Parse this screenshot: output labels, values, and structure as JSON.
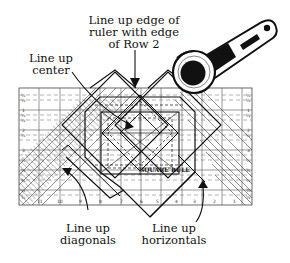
{
  "diagram": {
    "colors": {
      "ink": "#111111",
      "grid": "#555555",
      "background": "#ffffff"
    },
    "labels": {
      "top": {
        "lines": [
          "Line up edge of",
          "ruler with edge",
          "of Row 2"
        ]
      },
      "left": {
        "lines": [
          "Line up",
          "center"
        ]
      },
      "bottom_left": {
        "lines": [
          "Line up",
          "diagonals"
        ]
      },
      "bottom_right": {
        "lines": [
          "Line up",
          "horizontals"
        ]
      }
    },
    "ruler": {
      "brand_text": "SQUARE RULE",
      "left_scale": [
        "1/4",
        "1/2",
        "1",
        "1/4",
        "1/2",
        "2",
        "1/4",
        "3",
        "1/4",
        "1/2",
        "3/4",
        "1/2",
        "3/4"
      ],
      "right_scale": [
        "1/4",
        "1/2",
        "1",
        "1/4",
        "1/2",
        "2",
        "1/4",
        "3",
        "1/4",
        "1/2",
        "3/4",
        "1/2",
        "3/4"
      ],
      "bottom_scale": [
        "11",
        "10",
        "9",
        "8",
        "7",
        "6",
        "5",
        "4",
        "3",
        "2",
        "1"
      ]
    },
    "icons": {
      "cutter": "rotary-cutter-icon",
      "arrows": [
        "arrow-down-icon",
        "arrow-center-icon",
        "arrow-diagonals-icon",
        "arrow-horizontals-icon"
      ]
    }
  }
}
